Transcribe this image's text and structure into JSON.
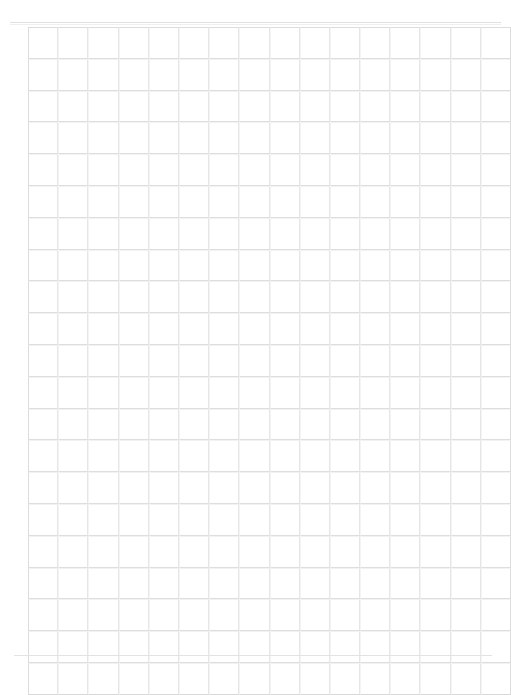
{
  "document": {
    "title": "Blank Grid Sheet",
    "kind": "empty-table-grid",
    "background_color": "#ffffff",
    "width_px": 511,
    "height_px": 677
  },
  "rules": {
    "top_rule_color": "#e0e0e0",
    "top_rule_secondary_color": "#efefef",
    "bottom_rule_color": "#e2e2e2"
  },
  "grid": {
    "columns": 16,
    "rows": 21,
    "cell_width_px": 28.5,
    "cell_height_px": 29.8,
    "origin_x_px": 28,
    "origin_y_px": 27,
    "line_color": "#e6e6e6",
    "row_line_color": "#dedede",
    "outer_line_color": "#dcdcdc",
    "column_headers": [
      "",
      "",
      "",
      "",
      "",
      "",
      "",
      "",
      "",
      "",
      "",
      "",
      "",
      "",
      "",
      ""
    ],
    "cells": [
      [
        "",
        "",
        "",
        "",
        "",
        "",
        "",
        "",
        "",
        "",
        "",
        "",
        "",
        "",
        "",
        ""
      ],
      [
        "",
        "",
        "",
        "",
        "",
        "",
        "",
        "",
        "",
        "",
        "",
        "",
        "",
        "",
        "",
        ""
      ],
      [
        "",
        "",
        "",
        "",
        "",
        "",
        "",
        "",
        "",
        "",
        "",
        "",
        "",
        "",
        "",
        ""
      ],
      [
        "",
        "",
        "",
        "",
        "",
        "",
        "",
        "",
        "",
        "",
        "",
        "",
        "",
        "",
        "",
        ""
      ],
      [
        "",
        "",
        "",
        "",
        "",
        "",
        "",
        "",
        "",
        "",
        "",
        "",
        "",
        "",
        "",
        ""
      ],
      [
        "",
        "",
        "",
        "",
        "",
        "",
        "",
        "",
        "",
        "",
        "",
        "",
        "",
        "",
        "",
        ""
      ],
      [
        "",
        "",
        "",
        "",
        "",
        "",
        "",
        "",
        "",
        "",
        "",
        "",
        "",
        "",
        "",
        ""
      ],
      [
        "",
        "",
        "",
        "",
        "",
        "",
        "",
        "",
        "",
        "",
        "",
        "",
        "",
        "",
        "",
        ""
      ],
      [
        "",
        "",
        "",
        "",
        "",
        "",
        "",
        "",
        "",
        "",
        "",
        "",
        "",
        "",
        "",
        ""
      ],
      [
        "",
        "",
        "",
        "",
        "",
        "",
        "",
        "",
        "",
        "",
        "",
        "",
        "",
        "",
        "",
        ""
      ],
      [
        "",
        "",
        "",
        "",
        "",
        "",
        "",
        "",
        "",
        "",
        "",
        "",
        "",
        "",
        "",
        ""
      ],
      [
        "",
        "",
        "",
        "",
        "",
        "",
        "",
        "",
        "",
        "",
        "",
        "",
        "",
        "",
        "",
        ""
      ],
      [
        "",
        "",
        "",
        "",
        "",
        "",
        "",
        "",
        "",
        "",
        "",
        "",
        "",
        "",
        "",
        ""
      ],
      [
        "",
        "",
        "",
        "",
        "",
        "",
        "",
        "",
        "",
        "",
        "",
        "",
        "",
        "",
        "",
        ""
      ],
      [
        "",
        "",
        "",
        "",
        "",
        "",
        "",
        "",
        "",
        "",
        "",
        "",
        "",
        "",
        "",
        ""
      ],
      [
        "",
        "",
        "",
        "",
        "",
        "",
        "",
        "",
        "",
        "",
        "",
        "",
        "",
        "",
        "",
        ""
      ],
      [
        "",
        "",
        "",
        "",
        "",
        "",
        "",
        "",
        "",
        "",
        "",
        "",
        "",
        "",
        "",
        ""
      ],
      [
        "",
        "",
        "",
        "",
        "",
        "",
        "",
        "",
        "",
        "",
        "",
        "",
        "",
        "",
        "",
        ""
      ],
      [
        "",
        "",
        "",
        "",
        "",
        "",
        "",
        "",
        "",
        "",
        "",
        "",
        "",
        "",
        "",
        ""
      ],
      [
        "",
        "",
        "",
        "",
        "",
        "",
        "",
        "",
        "",
        "",
        "",
        "",
        "",
        "",
        "",
        ""
      ],
      [
        "",
        "",
        "",
        "",
        "",
        "",
        "",
        "",
        "",
        "",
        "",
        "",
        "",
        "",
        "",
        ""
      ]
    ]
  }
}
